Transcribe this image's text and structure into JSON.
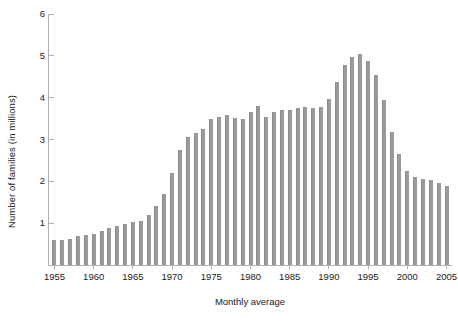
{
  "chart_data": {
    "type": "bar",
    "title": "",
    "xlabel": "Monthly average",
    "ylabel": "Number of families (in millions)",
    "ylim": [
      0,
      6
    ],
    "yticks": [
      1,
      2,
      3,
      4,
      5,
      6
    ],
    "ytick_labels": [
      "1",
      "2",
      "3",
      "4",
      "5",
      "6"
    ],
    "xlim": [
      1954.3,
      2005.7
    ],
    "xticks": [
      1955,
      1960,
      1965,
      1970,
      1975,
      1980,
      1985,
      1990,
      1995,
      2000,
      2005
    ],
    "xtick_labels": [
      "1955",
      "1960",
      "1965",
      "1970",
      "1975",
      "1980",
      "1985",
      "1990",
      "1995",
      "2000",
      "2005"
    ],
    "grid": false,
    "legend": null,
    "bar_color": "#9b9b9b",
    "axis_color": "#b0b0b0",
    "text_color": "#1a1a1a",
    "categories": [
      "1955",
      "1956",
      "1957",
      "1958",
      "1959",
      "1960",
      "1961",
      "1962",
      "1963",
      "1964",
      "1965",
      "1966",
      "1967",
      "1968",
      "1969",
      "1970",
      "1971",
      "1972",
      "1973",
      "1974",
      "1975",
      "1976",
      "1977",
      "1978",
      "1979",
      "1980",
      "1981",
      "1982",
      "1983",
      "1984",
      "1985",
      "1986",
      "1987",
      "1988",
      "1989",
      "1990",
      "1991",
      "1992",
      "1993",
      "1994",
      "1995",
      "1996",
      "1997",
      "1998",
      "1999",
      "2000",
      "2001",
      "2002",
      "2003",
      "2004",
      "2005"
    ],
    "values": [
      0.6,
      0.6,
      0.62,
      0.7,
      0.71,
      0.75,
      0.82,
      0.88,
      0.93,
      0.98,
      1.02,
      1.06,
      1.2,
      1.4,
      1.7,
      2.2,
      2.75,
      3.05,
      3.15,
      3.25,
      3.5,
      3.55,
      3.58,
      3.52,
      3.5,
      3.65,
      3.8,
      3.55,
      3.65,
      3.7,
      3.7,
      3.75,
      3.78,
      3.75,
      3.77,
      3.97,
      4.37,
      4.77,
      4.98,
      5.05,
      4.88,
      4.55,
      3.95,
      3.18,
      2.65,
      2.25,
      2.1,
      2.05,
      2.03,
      1.95,
      1.88
    ],
    "peak": {
      "year": "1994",
      "value": 5.05
    },
    "minimum": {
      "year": "1955",
      "value": 0.6
    }
  },
  "axis": {
    "ylabel_text": "Number of families (in millions)",
    "xlabel_text": "Monthly average"
  }
}
